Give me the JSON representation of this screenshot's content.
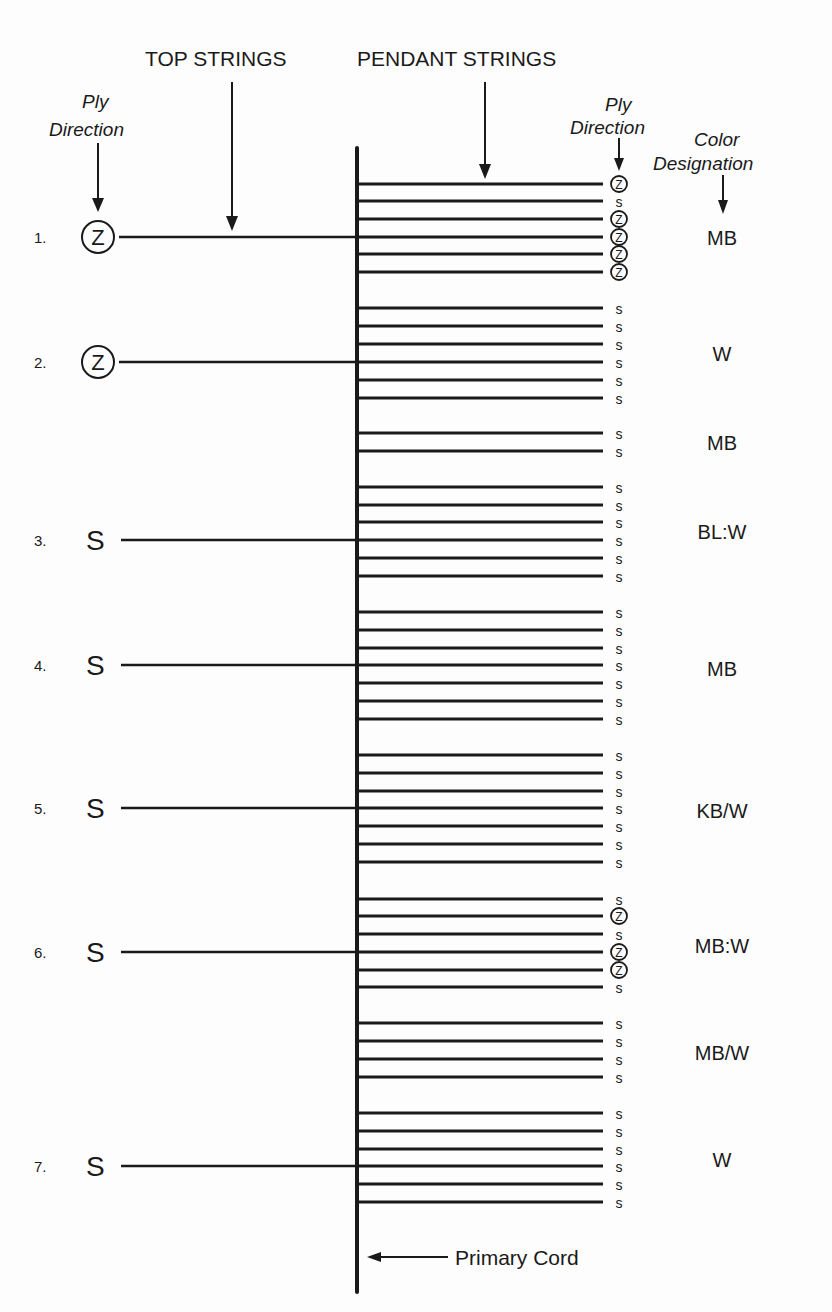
{
  "headers": {
    "top_strings": "TOP STRINGS",
    "pendant_strings": "PENDANT STRINGS",
    "ply_direction_left_line1": "Ply",
    "ply_direction_left_line2": "Direction",
    "ply_direction_right_line1": "Ply",
    "ply_direction_right_line2": "Direction",
    "color_designation_line1": "Color",
    "color_designation_line2": "Designation"
  },
  "primary_cord_label": "Primary Cord",
  "colors": {
    "ink": "#1a1a1a",
    "background": "#fdfdfd"
  },
  "top_strings": [
    {
      "number": "1.",
      "ply": "Z",
      "circled": true,
      "y": 237
    },
    {
      "number": "2.",
      "ply": "Z",
      "circled": true,
      "y": 362
    },
    {
      "number": "3.",
      "ply": "S",
      "circled": false,
      "y": 540
    },
    {
      "number": "4.",
      "ply": "S",
      "circled": false,
      "y": 665
    },
    {
      "number": "5.",
      "ply": "S",
      "circled": false,
      "y": 808
    },
    {
      "number": "6.",
      "ply": "S",
      "circled": false,
      "y": 952
    },
    {
      "number": "7.",
      "ply": "S",
      "circled": false,
      "y": 1166
    }
  ],
  "pendant_groups": [
    {
      "color": "MB",
      "label_y": 237,
      "pendants": [
        {
          "y": 184,
          "ply": "Z"
        },
        {
          "y": 201,
          "ply": "S"
        },
        {
          "y": 219,
          "ply": "Z"
        },
        {
          "y": 237,
          "ply": "Z"
        },
        {
          "y": 254,
          "ply": "Z"
        },
        {
          "y": 272,
          "ply": "Z"
        }
      ]
    },
    {
      "color": "W",
      "label_y": 353,
      "pendants": [
        {
          "y": 308,
          "ply": "S"
        },
        {
          "y": 326,
          "ply": "S"
        },
        {
          "y": 344,
          "ply": "S"
        },
        {
          "y": 362,
          "ply": "S"
        },
        {
          "y": 380,
          "ply": "S"
        },
        {
          "y": 398,
          "ply": "S"
        }
      ]
    },
    {
      "color": "MB",
      "label_y": 442,
      "pendants": [
        {
          "y": 433,
          "ply": "S"
        },
        {
          "y": 451,
          "ply": "S"
        }
      ]
    },
    {
      "color": "BL:W",
      "label_y": 531,
      "pendants": [
        {
          "y": 487,
          "ply": "S"
        },
        {
          "y": 505,
          "ply": "S"
        },
        {
          "y": 522,
          "ply": "S"
        },
        {
          "y": 540,
          "ply": "S"
        },
        {
          "y": 558,
          "ply": "S"
        },
        {
          "y": 576,
          "ply": "S"
        }
      ]
    },
    {
      "color": "MB",
      "label_y": 668,
      "pendants": [
        {
          "y": 612,
          "ply": "S"
        },
        {
          "y": 630,
          "ply": "S"
        },
        {
          "y": 648,
          "ply": "S"
        },
        {
          "y": 665,
          "ply": "S"
        },
        {
          "y": 683,
          "ply": "S"
        },
        {
          "y": 701,
          "ply": "S"
        },
        {
          "y": 719,
          "ply": "S"
        }
      ]
    },
    {
      "color": "KB/W",
      "label_y": 810,
      "pendants": [
        {
          "y": 755,
          "ply": "S"
        },
        {
          "y": 773,
          "ply": "S"
        },
        {
          "y": 791,
          "ply": "S"
        },
        {
          "y": 808,
          "ply": "S"
        },
        {
          "y": 826,
          "ply": "S"
        },
        {
          "y": 844,
          "ply": "S"
        },
        {
          "y": 862,
          "ply": "S"
        }
      ]
    },
    {
      "color": "MB:W",
      "label_y": 945,
      "pendants": [
        {
          "y": 899,
          "ply": "S"
        },
        {
          "y": 916,
          "ply": "Z"
        },
        {
          "y": 934,
          "ply": "S"
        },
        {
          "y": 952,
          "ply": "Z"
        },
        {
          "y": 970,
          "ply": "Z"
        },
        {
          "y": 987,
          "ply": "S"
        }
      ]
    },
    {
      "color": "MB/W",
      "label_y": 1052,
      "pendants": [
        {
          "y": 1023,
          "ply": "S"
        },
        {
          "y": 1041,
          "ply": "S"
        },
        {
          "y": 1059,
          "ply": "S"
        },
        {
          "y": 1077,
          "ply": "S"
        }
      ]
    },
    {
      "color": "W",
      "label_y": 1159,
      "pendants": [
        {
          "y": 1113,
          "ply": "S"
        },
        {
          "y": 1131,
          "ply": "S"
        },
        {
          "y": 1149,
          "ply": "S"
        },
        {
          "y": 1166,
          "ply": "S"
        },
        {
          "y": 1184,
          "ply": "S"
        },
        {
          "y": 1202,
          "ply": "S"
        }
      ]
    }
  ]
}
